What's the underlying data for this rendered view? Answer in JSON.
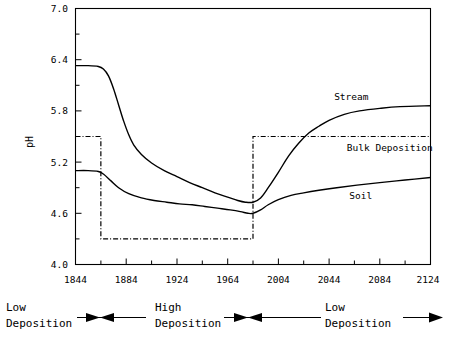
{
  "chart_data": {
    "type": "line",
    "title": "",
    "xlabel": "",
    "ylabel": "pH",
    "xlim": [
      1844,
      2124
    ],
    "ylim": [
      4.0,
      7.0
    ],
    "grid": false,
    "legend_position": "inline-right",
    "x_ticks": [
      1844,
      1884,
      1924,
      1964,
      2004,
      2044,
      2084,
      2124
    ],
    "x_tick_labels": [
      "1844",
      "1884",
      "1924",
      "1964",
      "2004",
      "2044",
      "2084",
      "2124"
    ],
    "x_minor_step": 20,
    "y_ticks": [
      4.0,
      4.6,
      5.2,
      5.8,
      6.4,
      7.0
    ],
    "y_tick_labels": [
      "4.0",
      "4.6",
      "5.2",
      "5.8",
      "6.4",
      "7.0"
    ],
    "y_minor_step": 0.3,
    "series": [
      {
        "name": "Stream",
        "style": "solid",
        "label": "Stream",
        "x": [
          1844,
          1854,
          1862,
          1866,
          1870,
          1874,
          1878,
          1882,
          1886,
          1890,
          1896,
          1904,
          1914,
          1924,
          1934,
          1944,
          1954,
          1964,
          1972,
          1978,
          1984,
          1990,
          1996,
          2004,
          2012,
          2020,
          2028,
          2036,
          2044,
          2056,
          2068,
          2084,
          2100,
          2124
        ],
        "values": [
          6.33,
          6.33,
          6.32,
          6.29,
          6.21,
          6.06,
          5.87,
          5.68,
          5.52,
          5.4,
          5.29,
          5.19,
          5.1,
          5.03,
          4.96,
          4.9,
          4.84,
          4.79,
          4.75,
          4.73,
          4.73,
          4.78,
          4.9,
          5.08,
          5.27,
          5.42,
          5.54,
          5.62,
          5.69,
          5.76,
          5.8,
          5.83,
          5.85,
          5.86
        ]
      },
      {
        "name": "Soil",
        "style": "solid",
        "label": "Soil",
        "x": [
          1844,
          1854,
          1862,
          1866,
          1872,
          1878,
          1886,
          1896,
          1906,
          1916,
          1926,
          1936,
          1946,
          1956,
          1966,
          1974,
          1980,
          1984,
          1990,
          1996,
          2004,
          2014,
          2024,
          2036,
          2050,
          2066,
          2084,
          2104,
          2124
        ],
        "values": [
          5.1,
          5.1,
          5.09,
          5.06,
          4.98,
          4.9,
          4.83,
          4.78,
          4.75,
          4.73,
          4.71,
          4.7,
          4.68,
          4.66,
          4.64,
          4.62,
          4.6,
          4.6,
          4.64,
          4.7,
          4.76,
          4.81,
          4.84,
          4.87,
          4.9,
          4.93,
          4.96,
          4.99,
          5.02
        ]
      },
      {
        "name": "Bulk Deposition",
        "style": "dash-dot",
        "label": "Bulk Deposition",
        "x": [
          1844,
          1864,
          1864,
          1984,
          1984,
          2124
        ],
        "values": [
          5.5,
          5.5,
          4.3,
          4.3,
          5.5,
          5.5
        ]
      }
    ],
    "annotations": [
      {
        "name": "stream-label",
        "text": "Stream",
        "x": 2048,
        "y": 5.93
      },
      {
        "name": "bulk-deposition-label",
        "text": "Bulk Deposition",
        "x": 2058,
        "y": 5.33
      },
      {
        "name": "soil-label",
        "text": "Soil",
        "x": 2060,
        "y": 4.77
      }
    ],
    "periods": [
      {
        "name": "low-deposition-left",
        "line1": "Low",
        "line2": "Deposition",
        "arrow": "double"
      },
      {
        "name": "high-deposition",
        "line1": "High",
        "line2": "Deposition",
        "arrow": "double"
      },
      {
        "name": "low-deposition-right",
        "line1": "Low",
        "line2": "Deposition",
        "arrow": "right"
      }
    ]
  },
  "colors": {
    "ink": "#000000",
    "background": "#ffffff"
  }
}
